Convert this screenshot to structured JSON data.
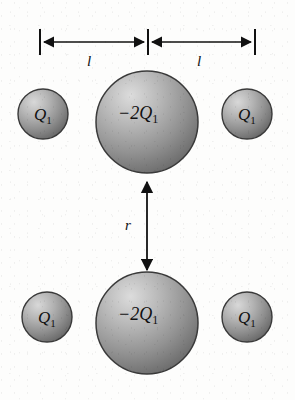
{
  "figure": {
    "name": "charge-configuration-diagram",
    "background_color": "#fdfdfc",
    "width": 295,
    "height": 400
  },
  "colors": {
    "sphere_fill_light": "#cfcfcf",
    "sphere_fill_mid": "#9a9a9a",
    "sphere_fill_dark": "#6e6e6e",
    "sphere_outline": "#3a3a3a",
    "ink": "#111111"
  },
  "charges": {
    "small_label": "Q",
    "small_subscript": "1",
    "large_label": "−2Q",
    "large_subscript": "1"
  },
  "dimensions": {
    "horizontal_label": "l",
    "vertical_label": "r"
  },
  "spheres": [
    {
      "id": "top-left-small",
      "row": "top",
      "position": "left",
      "cx": 43,
      "cy": 114,
      "r": 25,
      "label": "Q",
      "subscript": "1",
      "label_x": 34,
      "label_y": 120,
      "font_size": 17
    },
    {
      "id": "top-center-large",
      "row": "top",
      "position": "center",
      "cx": 147,
      "cy": 122,
      "r": 51,
      "label": "−2Q",
      "subscript": "1",
      "label_x": 118,
      "label_y": 119,
      "font_size": 18
    },
    {
      "id": "top-right-small",
      "row": "top",
      "position": "right",
      "cx": 247,
      "cy": 114,
      "r": 25,
      "label": "Q",
      "subscript": "1",
      "label_x": 238,
      "label_y": 120,
      "font_size": 17
    },
    {
      "id": "bottom-left-small",
      "row": "bottom",
      "position": "left",
      "cx": 47,
      "cy": 317,
      "r": 25,
      "label": "Q",
      "subscript": "1",
      "label_x": 38,
      "label_y": 323,
      "font_size": 17
    },
    {
      "id": "bottom-center-large",
      "row": "bottom",
      "position": "center",
      "cx": 147,
      "cy": 323,
      "r": 51,
      "label": "−2Q",
      "subscript": "1",
      "label_x": 118,
      "label_y": 320,
      "font_size": 18
    },
    {
      "id": "bottom-right-small",
      "row": "bottom",
      "position": "right",
      "cx": 247,
      "cy": 317,
      "r": 25,
      "label": "Q",
      "subscript": "1",
      "label_x": 238,
      "label_y": 323,
      "font_size": 17
    }
  ],
  "dimension_lines": {
    "horizontal": {
      "axis_y": 42,
      "tick_top": 29,
      "tick_bottom": 55,
      "ticks_x": [
        40,
        148,
        255
      ],
      "segments": [
        {
          "id": "left-span",
          "x1": 40,
          "x2": 148,
          "label": "l",
          "label_x": 89,
          "label_y": 66
        },
        {
          "id": "right-span",
          "x1": 148,
          "x2": 255,
          "label": "l",
          "label_x": 199,
          "label_y": 66
        }
      ]
    },
    "vertical": {
      "x": 147,
      "y1": 179,
      "y2": 273,
      "label": "r",
      "label_x": 128,
      "label_y": 230
    }
  }
}
